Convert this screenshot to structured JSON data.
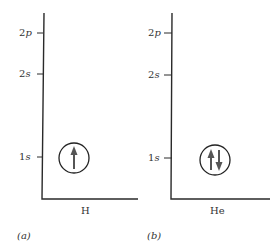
{
  "panels": [
    {
      "id": "a",
      "caption": "(a)",
      "element": "H",
      "levels": [
        {
          "label": "2p",
          "num": "2",
          "sub": "p"
        },
        {
          "label": "2s",
          "num": "2",
          "sub": "s"
        },
        {
          "label": "1s",
          "num": "1",
          "sub": "s"
        }
      ],
      "occupied_level": "1s",
      "electrons": [
        "up"
      ]
    },
    {
      "id": "b",
      "caption": "(b)",
      "element": "He",
      "levels": [
        {
          "label": "2p",
          "num": "2",
          "sub": "p"
        },
        {
          "label": "2s",
          "num": "2",
          "sub": "s"
        },
        {
          "label": "1s",
          "num": "1",
          "sub": "s"
        }
      ],
      "occupied_level": "1s",
      "electrons": [
        "up",
        "down"
      ]
    }
  ],
  "colors": {
    "axis": "#2a2a2a",
    "arrow": "#555555",
    "text": "#333333"
  }
}
